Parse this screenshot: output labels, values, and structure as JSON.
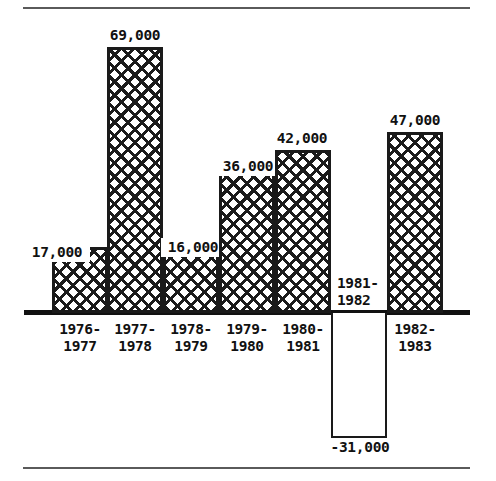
{
  "chart_data": {
    "type": "bar",
    "title": "",
    "subtitle": "",
    "xlabel": "",
    "ylabel": "",
    "grid": false,
    "legend": null,
    "ylim": [
      -31000,
      69000
    ],
    "zero_line": 0,
    "categories": [
      "1976-\n1977",
      "1977-\n1978",
      "1978-\n1979",
      "1979-\n1980",
      "1980-\n1981",
      "1981-\n1982",
      "1982-\n1983"
    ],
    "values": [
      17000,
      69000,
      16000,
      36000,
      42000,
      -31000,
      47000
    ],
    "value_labels": [
      "17,000",
      "69,000",
      "16,000",
      "36,000",
      "42,000",
      "-31,000",
      "47,000"
    ]
  },
  "bars": [
    {
      "category_label": "1976-\n1977",
      "value_label": "17,000",
      "value": 17000,
      "sign": "positive",
      "fill": "crosshatch",
      "geom": {
        "left": 52,
        "width": 56,
        "top": 247,
        "height": 66
      },
      "value_label_pos": {
        "left": 24,
        "top": 243,
        "width": 62,
        "boxed": true
      },
      "category_label_pos": {
        "left": 49,
        "top": 321,
        "inbar": false
      }
    },
    {
      "category_label": "1977-\n1978",
      "value_label": "69,000",
      "value": 69000,
      "sign": "positive",
      "fill": "crosshatch",
      "geom": {
        "left": 107,
        "width": 56,
        "top": 47,
        "height": 266
      },
      "value_label_pos": {
        "left": 104,
        "top": 28,
        "width": 62,
        "boxed": false
      },
      "category_label_pos": {
        "left": 104,
        "top": 321,
        "inbar": false
      }
    },
    {
      "category_label": "1978-\n1979",
      "value_label": "16,000",
      "value": 16000,
      "sign": "positive",
      "fill": "crosshatch",
      "geom": {
        "left": 163,
        "width": 56,
        "top": 251,
        "height": 62
      },
      "value_label_pos": {
        "left": 161,
        "top": 238,
        "width": 60,
        "boxed": true
      },
      "category_label_pos": {
        "left": 160,
        "top": 321,
        "inbar": false
      }
    },
    {
      "category_label": "1979-\n1980",
      "value_label": "36,000",
      "value": 36000,
      "sign": "positive",
      "fill": "crosshatch",
      "geom": {
        "left": 219,
        "width": 56,
        "top": 173,
        "height": 140
      },
      "value_label_pos": {
        "left": 215,
        "top": 157,
        "width": 62,
        "boxed": true
      },
      "category_label_pos": {
        "left": 216,
        "top": 321,
        "inbar": false
      }
    },
    {
      "category_label": "1980-\n1981",
      "value_label": "42,000",
      "value": 42000,
      "sign": "positive",
      "fill": "crosshatch",
      "geom": {
        "left": 275,
        "width": 56,
        "top": 150,
        "height": 163
      },
      "value_label_pos": {
        "left": 271,
        "top": 131,
        "width": 62,
        "boxed": false
      },
      "category_label_pos": {
        "left": 272,
        "top": 321,
        "inbar": false
      }
    },
    {
      "category_label": "1981-\n1982",
      "value_label": "-31,000",
      "value": -31000,
      "sign": "negative",
      "fill": "empty",
      "geom": {
        "left": 331,
        "width": 56,
        "top": 313,
        "height": 125
      },
      "value_label_pos": {
        "left": 327,
        "top": 440,
        "width": 66,
        "boxed": false
      },
      "category_label_pos": {
        "left": 333,
        "top": 275,
        "inbar": true
      }
    },
    {
      "category_label": "1982-\n1983",
      "value_label": "47,000",
      "value": 47000,
      "sign": "positive",
      "fill": "crosshatch",
      "geom": {
        "left": 387,
        "width": 56,
        "top": 132,
        "height": 181
      },
      "value_label_pos": {
        "left": 384,
        "top": 113,
        "width": 62,
        "boxed": false
      },
      "category_label_pos": {
        "left": 384,
        "top": 321,
        "inbar": false
      }
    }
  ],
  "colors": {
    "ink": "#111111",
    "hatch": "#1b1b1b",
    "rule": "#5a5a5a",
    "background": "#ffffff"
  }
}
